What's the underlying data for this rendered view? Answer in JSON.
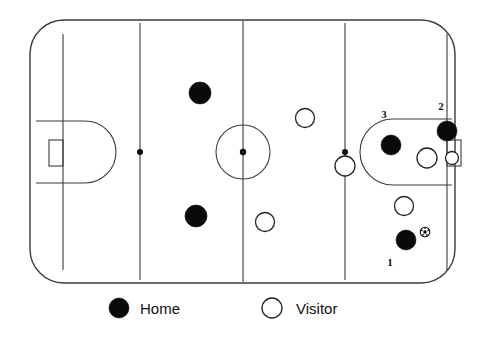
{
  "diagram": {
    "sport": "ice-hockey",
    "rink": {
      "x": 30,
      "y": 20,
      "width": 425,
      "height": 263,
      "corner_radius": 34,
      "stroke_color": "#3b3b3b",
      "fill_color": "#ffffff"
    },
    "lines": [
      {
        "name": "blue-line-left",
        "x": 140
      },
      {
        "name": "center-line",
        "x": 243
      },
      {
        "name": "blue-line-right",
        "x": 345
      }
    ],
    "center_circle": {
      "cx": 243,
      "cy": 152,
      "r": 27
    },
    "faceoff_dots": [
      {
        "name": "faceoff-dot-left-blue",
        "cx": 140,
        "cy": 152,
        "r": 3
      },
      {
        "name": "faceoff-dot-center-ice",
        "cx": 243,
        "cy": 152,
        "r": 3.2
      },
      {
        "name": "faceoff-dot-right-blue",
        "cx": 345,
        "cy": 152,
        "r": 3
      }
    ],
    "creases": [
      {
        "name": "crease-left",
        "side": "left",
        "goal_line_x": 63,
        "depth": 48,
        "half_height": 31
      },
      {
        "name": "crease-right",
        "side": "right",
        "goal_line_x": 447,
        "depth": 60,
        "half_height": 33
      }
    ],
    "goals": [
      {
        "name": "goal-left",
        "x": 49,
        "y": 140,
        "width": 14,
        "height": 26
      },
      {
        "name": "goal-right",
        "x": 447,
        "y": 140,
        "width": 14,
        "height": 26
      }
    ]
  },
  "players": [
    {
      "name": "home-player-upper-neutral",
      "team": "Home",
      "cx": 200,
      "cy": 93,
      "r": 11,
      "label": ""
    },
    {
      "name": "home-player-lower-neutral",
      "team": "Home",
      "cx": 196,
      "cy": 216,
      "r": 11,
      "label": ""
    },
    {
      "name": "home-player-3",
      "team": "Home",
      "cx": 391,
      "cy": 145,
      "r": 10,
      "label": "3",
      "label_x": 384,
      "label_y": 118
    },
    {
      "name": "home-player-2",
      "team": "Home",
      "cx": 447,
      "cy": 131,
      "r": 10,
      "label": "2",
      "label_x": 441,
      "label_y": 110
    },
    {
      "name": "home-player-1",
      "team": "Home",
      "cx": 406,
      "cy": 240,
      "r": 10,
      "label": "1",
      "label_x": 390,
      "label_y": 266
    },
    {
      "name": "visitor-player-upper-right-neutral",
      "team": "Visitor",
      "cx": 305,
      "cy": 118,
      "r": 9.5,
      "label": ""
    },
    {
      "name": "visitor-player-lower-neutral",
      "team": "Visitor",
      "cx": 265,
      "cy": 222,
      "r": 9.5,
      "label": ""
    },
    {
      "name": "visitor-player-on-blue-line",
      "team": "Visitor",
      "cx": 345,
      "cy": 166,
      "r": 10,
      "label": ""
    },
    {
      "name": "visitor-player-slot",
      "team": "Visitor",
      "cx": 427,
      "cy": 158,
      "r": 10,
      "label": ""
    },
    {
      "name": "visitor-goalie",
      "team": "Visitor",
      "cx": 452,
      "cy": 158,
      "r": 6.5,
      "label": ""
    },
    {
      "name": "visitor-player-point",
      "team": "Visitor",
      "cx": 404,
      "cy": 206,
      "r": 9.5,
      "label": ""
    }
  ],
  "puck": {
    "name": "puck",
    "cx": 425,
    "cy": 232,
    "r": 4.8
  },
  "legend": {
    "items": [
      {
        "name": "legend-home",
        "symbol": "filled-circle",
        "label": "Home",
        "marker_cx": 119,
        "marker_cy": 308,
        "marker_r": 10,
        "text_x": 140,
        "text_y": 314
      },
      {
        "name": "legend-visitor",
        "symbol": "open-circle",
        "label": "Visitor",
        "marker_cx": 272,
        "marker_cy": 308,
        "marker_r": 10,
        "text_x": 296,
        "text_y": 314
      }
    ]
  },
  "colors": {
    "home": "#0a0a0a",
    "visitor_fill": "#ffffff",
    "visitor_stroke": "#222222",
    "rink_stroke": "#3b3b3b",
    "text": "#111111",
    "background": "#ffffff"
  }
}
